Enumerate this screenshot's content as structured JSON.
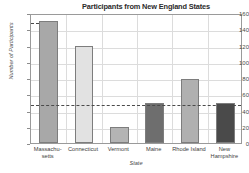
{
  "chart_data": {
    "type": "bar",
    "title": "Participants from New England States",
    "xlabel": "State",
    "ylabel": "Number of Participants",
    "categories": [
      "Massachu-\nsetts",
      "Connecticut",
      "Vermont",
      "Maine",
      "Rhode Island",
      "New\nHampshire"
    ],
    "category_lines": [
      [
        "Massachu-",
        "setts"
      ],
      [
        "Connecticut"
      ],
      [
        "Vermont"
      ],
      [
        "Maine"
      ],
      [
        "Rhode Island"
      ],
      [
        "New",
        "Hampshire"
      ]
    ],
    "values": [
      150,
      119,
      20,
      49,
      79,
      49
    ],
    "bar_colors": [
      "#a8a8a8",
      "#e2e2e2",
      "#b4b4b4",
      "#6e6e6e",
      "#b0b0b0",
      "#4a4a4a"
    ],
    "ylim": [
      0,
      160
    ],
    "yticks": [
      0,
      20,
      40,
      60,
      80,
      100,
      120,
      140,
      160
    ],
    "ytick_labels": [
      "0",
      "20",
      "40",
      "60",
      "80",
      "100",
      "120",
      "140",
      "160"
    ],
    "grid": true,
    "legend": "none",
    "annotations": [
      {
        "name": "reference-line-median",
        "y": 49,
        "style": "dashed",
        "span": "full"
      },
      {
        "name": "reference-line-max",
        "y": 150,
        "style": "dashed",
        "span": "to-first-bar"
      }
    ],
    "accent_color": "#4a4a4a",
    "frame_color": "#9a9a9a",
    "grid_color": "#dcdcdc"
  }
}
